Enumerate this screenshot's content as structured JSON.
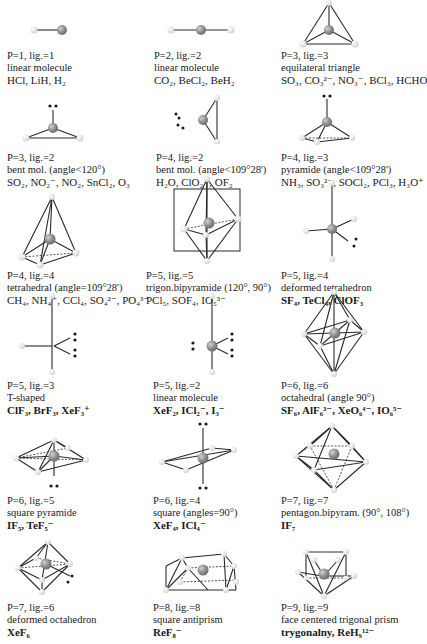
{
  "figure": {
    "colors": {
      "central_atom": "#8a8a8a",
      "ligand": "#e6e6e6",
      "lone_pair": "#1a1a1a",
      "bond": "#2a2a2a"
    },
    "cells": [
      {
        "id": "p1-l1",
        "pl": "P=1, lig.=1",
        "shape": "linear molecule",
        "examples": "HCl, LiH, H₂"
      },
      {
        "id": "p2-l2",
        "pl": "P=2, lig.=2",
        "shape": "linear molecule",
        "examples": "CO₂, BeCl₂, BeH₂"
      },
      {
        "id": "p3-l3",
        "pl": "P=3, lig.=3",
        "shape": "equilateral triangle",
        "examples": "SO₃, CO₃²⁻, NO₃⁻, BCl₃, HCHO"
      },
      {
        "id": "p3-l2",
        "pl": "P=3, lig.=2",
        "shape": "bent mol. (angle<120°)",
        "examples": "SO₂, NO₂⁻, NO₂, SnCl₂, O₃"
      },
      {
        "id": "p4-l2",
        "pl": "P=4, lig.=2",
        "shape": "bent mol. (angle<109°28')",
        "examples": "H₂O, ClO₂⁻, OF₂"
      },
      {
        "id": "p4-l3",
        "pl": "P=4, lig.=3",
        "shape": "pyramide (angle<109°28')",
        "examples": "NH₃, SO₃²⁻, SOCl₂, PCl₃, H₃O⁺"
      },
      {
        "id": "p4-l4",
        "pl": "P=4, lig.=4",
        "shape": "tetrahedral (angle=109°28')",
        "examples": "CH₄, NH₄⁺, CCl₄, SO₄²⁻, PO₄³⁻"
      },
      {
        "id": "p5-l5",
        "pl": "P=5, lig.=5",
        "shape": "trigon.bipyramide (120°, 90°)",
        "examples": "PCl₅, SOF₄, IO₅³⁻"
      },
      {
        "id": "p5-l4",
        "pl": "P=5, lig.=4",
        "shape": "deformed tetrahedron",
        "examples": "SF₄, TeCl₄, ClOF₃"
      },
      {
        "id": "p5-l3",
        "pl": "P=5, lig.=3",
        "shape": "T-shaped",
        "examples": "ClF₃, BrF₃, XeF₃⁺"
      },
      {
        "id": "p5-l2",
        "pl": "P=5, lig.=2",
        "shape": "linear molecule",
        "examples": "XeF₂, ICl₂⁻, I₃⁻"
      },
      {
        "id": "p6-l6",
        "pl": "P=6, lig.=6",
        "shape": "octahedral (angle 90°)",
        "examples": "SF₆, AlF₆³⁻, XeO₆⁴⁻, IO₆⁵⁻"
      },
      {
        "id": "p6-l5",
        "pl": "P=6, lig.=5",
        "shape": "square pyramide",
        "examples": "IF₅, TeF₅⁻"
      },
      {
        "id": "p6-l4",
        "pl": "P=6, lig.=4",
        "shape": "square (angles=90°)",
        "examples": "XeF₄, ICl₄⁻"
      },
      {
        "id": "p7-l7",
        "pl": "P=7, lig.=7",
        "shape": "pentagon.bipyram. (90°, 108°)",
        "examples": "IF₇"
      },
      {
        "id": "p7-l6",
        "pl": "P=7, lig.=6",
        "shape": "deformed octahedron",
        "examples": "XeF₆"
      },
      {
        "id": "p8-l8",
        "pl": "P=8, lig.=8",
        "shape": "square antiprism",
        "examples": "ReF₈⁻"
      },
      {
        "id": "p9-l9",
        "pl": "P=9, lig.=9",
        "shape": "face centered trigonal prism",
        "examples": "trygonalny, ReH₉¹²⁻"
      }
    ]
  }
}
